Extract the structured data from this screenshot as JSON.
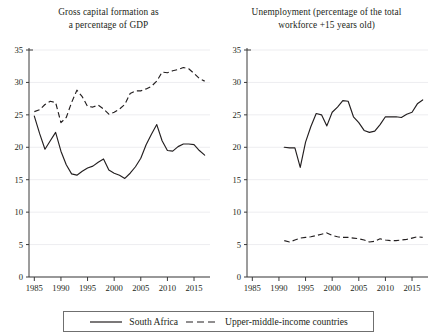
{
  "figure": {
    "width": 435,
    "height": 335,
    "background": "#ffffff",
    "ink_color": "#231f20",
    "gridline_color": "#ededf0",
    "axis_color": "#3a3a3a"
  },
  "legend": {
    "entries": [
      {
        "label": "South Africa",
        "style": "solid",
        "icon": "solid-line-swatch"
      },
      {
        "label": "Upper-middle-income countries",
        "style": "dashed",
        "icon": "dashed-line-swatch"
      }
    ]
  },
  "chart_data": [
    {
      "type": "line",
      "panel": "left",
      "title": "Gross capital formation as a percentage of GDP",
      "title_lines": [
        "Gross capital formation as",
        "a percentage of GDP"
      ],
      "xlabel": "",
      "ylabel": "",
      "xlim": [
        1984,
        2018
      ],
      "ylim": [
        0,
        35
      ],
      "xticks": [
        1985,
        1990,
        1995,
        2000,
        2005,
        2010,
        2015
      ],
      "yticks": [
        0,
        5,
        10,
        15,
        20,
        25,
        30,
        35
      ],
      "grid": "horizontal",
      "legend_position": "bottom-shared",
      "series": [
        {
          "name": "South Africa",
          "style": "solid",
          "x": [
            1985,
            1986,
            1987,
            1988,
            1989,
            1990,
            1991,
            1992,
            1993,
            1994,
            1995,
            1996,
            1997,
            1998,
            1999,
            2000,
            2001,
            2002,
            2003,
            2004,
            2005,
            2006,
            2007,
            2008,
            2009,
            2010,
            2011,
            2012,
            2013,
            2014,
            2015,
            2016,
            2017
          ],
          "values": [
            24.8,
            22.1,
            19.7,
            21.0,
            22.3,
            19.4,
            17.3,
            15.9,
            15.7,
            16.3,
            16.8,
            17.1,
            17.7,
            18.2,
            16.5,
            16.0,
            15.7,
            15.2,
            16.0,
            17.0,
            18.3,
            20.4,
            22.0,
            23.5,
            21.0,
            19.5,
            19.4,
            20.1,
            20.5,
            20.5,
            20.4,
            19.5,
            18.8
          ]
        },
        {
          "name": "Upper-middle-income countries",
          "style": "dashed",
          "x": [
            1985,
            1986,
            1987,
            1988,
            1989,
            1990,
            1991,
            1992,
            1993,
            1994,
            1995,
            1996,
            1997,
            1998,
            1999,
            2000,
            2001,
            2002,
            2003,
            2004,
            2005,
            2006,
            2007,
            2008,
            2009,
            2010,
            2011,
            2012,
            2013,
            2014,
            2015,
            2016,
            2017
          ],
          "values": [
            25.5,
            25.8,
            26.6,
            27.1,
            26.9,
            23.8,
            24.6,
            26.9,
            28.8,
            27.8,
            26.3,
            26.2,
            26.5,
            25.9,
            25.1,
            25.4,
            25.9,
            26.6,
            28.3,
            28.7,
            28.7,
            29.0,
            29.4,
            30.2,
            31.6,
            31.5,
            31.8,
            32.0,
            32.3,
            32.1,
            31.4,
            30.6,
            30.2
          ]
        }
      ]
    },
    {
      "type": "line",
      "panel": "right",
      "title": "Unemployment (percentage of the total workforce +15 years old)",
      "title_lines": [
        "Unemployment (percentage of the total",
        "workforce +15 years old)"
      ],
      "xlabel": "",
      "ylabel": "",
      "xlim": [
        1984,
        2018
      ],
      "ylim": [
        0,
        35
      ],
      "xticks": [
        1985,
        1990,
        1995,
        2000,
        2005,
        2010,
        2015
      ],
      "yticks": [
        0,
        5,
        10,
        15,
        20,
        25,
        30,
        35
      ],
      "grid": "horizontal",
      "legend_position": "bottom-shared",
      "series": [
        {
          "name": "South Africa",
          "style": "solid",
          "x": [
            1991,
            1992,
            1993,
            1994,
            1995,
            1996,
            1997,
            1998,
            1999,
            2000,
            2001,
            2002,
            2003,
            2004,
            2005,
            2006,
            2007,
            2008,
            2009,
            2010,
            2011,
            2012,
            2013,
            2014,
            2015,
            2016,
            2017
          ],
          "values": [
            20.0,
            19.9,
            19.9,
            16.9,
            20.8,
            23.2,
            25.2,
            25.0,
            23.3,
            25.4,
            26.2,
            27.2,
            27.1,
            24.7,
            23.8,
            22.6,
            22.3,
            22.5,
            23.5,
            24.7,
            24.7,
            24.7,
            24.6,
            25.1,
            25.4,
            26.7,
            27.3
          ]
        },
        {
          "name": "Upper-middle-income countries",
          "style": "dashed",
          "x": [
            1991,
            1992,
            1993,
            1994,
            1995,
            1996,
            1997,
            1998,
            1999,
            2000,
            2001,
            2002,
            2003,
            2004,
            2005,
            2006,
            2007,
            2008,
            2009,
            2010,
            2011,
            2012,
            2013,
            2014,
            2015,
            2016,
            2017
          ],
          "values": [
            5.6,
            5.4,
            5.7,
            6.0,
            6.1,
            6.2,
            6.4,
            6.6,
            6.8,
            6.4,
            6.2,
            6.1,
            6.1,
            6.0,
            5.9,
            5.7,
            5.4,
            5.5,
            5.9,
            5.7,
            5.6,
            5.6,
            5.7,
            5.8,
            6.0,
            6.2,
            6.1
          ]
        }
      ]
    }
  ]
}
